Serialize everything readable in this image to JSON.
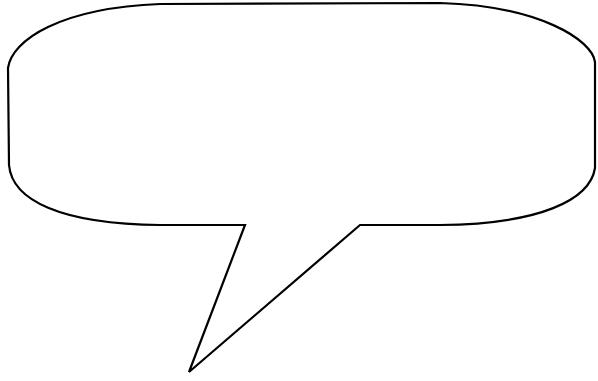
{
  "image": {
    "type": "speech-bubble-outline",
    "background_color": "#ffffff",
    "stroke_color": "#000000",
    "fill_color": "#ffffff"
  },
  "bubble": {
    "text": ""
  }
}
